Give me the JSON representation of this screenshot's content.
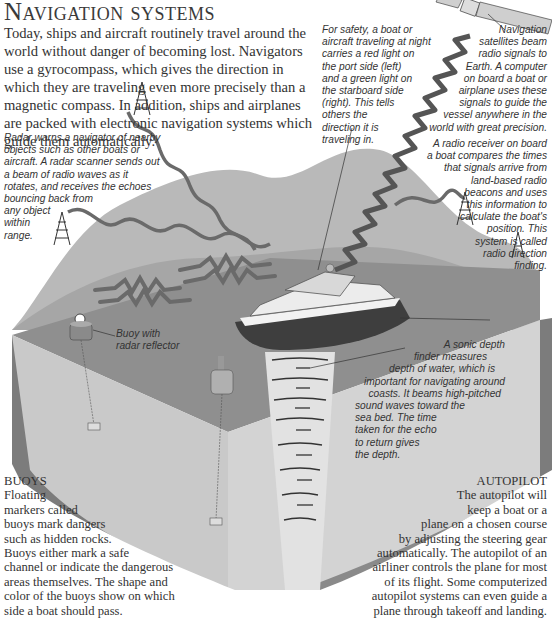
{
  "page": {
    "title": "Navigation systems",
    "intro_lines": [
      "Today, ships and aircraft routinely travel around the",
      "world without danger of becoming lost. Navigators",
      "use a gyrocompass, which gives the direction in",
      "which they are traveling even more precisely than a",
      "magnetic compass. In addition, ships and airplanes",
      "are packed with electronic navigation systems which",
      "guide them automatically."
    ]
  },
  "captions": {
    "radar": [
      "Radar warns a navigator of nearby",
      "objects such as other boats or",
      "aircraft. A radar scanner sends out",
      "a beam of radio waves as it",
      "rotates, and receives the echoes",
      "bouncing back from",
      "any object",
      "within",
      "range."
    ],
    "lights": [
      "For safety, a boat or",
      "aircraft traveling at night",
      "carries a red light on",
      "the port side (left)",
      "and a green light on",
      "the starboard side",
      "(right). This tells",
      "others the",
      "direction it is",
      "traveling in."
    ],
    "satellite": [
      "Navigation",
      "satellites beam",
      "radio signals to",
      "Earth. A computer",
      "on board a boat or",
      "airplane uses these",
      "signals to guide the",
      "vessel anywhere in the",
      "world with great precision."
    ],
    "radio_direction": [
      "A radio receiver on board",
      "a boat compares the times",
      "that signals arrive from",
      "land-based radio",
      "beacons and uses",
      "this information to",
      "calculate the boat's",
      "position. This",
      "system is called",
      "radio direction",
      "finding."
    ],
    "buoy_label": [
      "Buoy with",
      "radar reflector"
    ],
    "sonic": [
      "A sonic depth",
      "finder measures",
      "depth of water, which is",
      "important for navigating around",
      "coasts. It beams high-pitched",
      "sound waves toward the",
      "sea bed. The time",
      "taken for the echo",
      "to return gives",
      "the depth."
    ]
  },
  "sections": {
    "buoys": {
      "heading": "BUOYS",
      "lines": [
        "Floating",
        "markers called",
        "buoys mark dangers",
        "such as hidden rocks.",
        "Buoys either mark a safe",
        "channel or indicate the dangerous",
        "areas themselves. The shape and",
        "color of the buoys show on which",
        "side a boat should pass."
      ]
    },
    "autopilot": {
      "heading": "AUTOPILOT",
      "lines": [
        "The autopilot will",
        "keep a boat or a",
        "plane on a chosen course",
        "by adjusting the steering gear",
        "automatically. The autopilot of an",
        "airliner controls the plane for most",
        "of its flight. Some computerized",
        "autopilot systems can even guide a",
        "plane through takeoff and landing."
      ]
    }
  },
  "colors": {
    "land": "#b9b9b9",
    "land_shadow": "#9a9a9a",
    "sea_surface": "#8f8f8f",
    "sea_body": "#c9c9c9",
    "side_wall": "#7c7c7c",
    "wave": "#6a6a6a"
  }
}
